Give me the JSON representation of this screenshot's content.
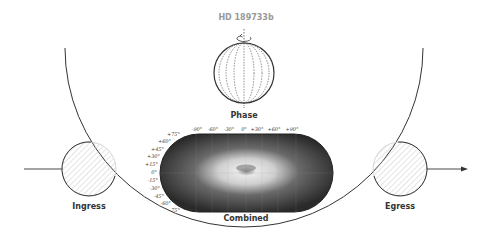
{
  "title": "HD 189733b",
  "labels": {
    "phase": "Phase",
    "combined": "Combined",
    "ingress": "Ingress",
    "egress": "Egress"
  },
  "map": {
    "longitude_ticks": [
      "-90°",
      "-60°",
      "-30°",
      "0°",
      "+30°",
      "+60°",
      "+90°"
    ],
    "latitude_ticks": [
      "+75°",
      "+60°",
      "+45°",
      "+30°",
      "+15°",
      "0°",
      "-15°",
      "-30°",
      "-45°",
      "-60°",
      "-75°"
    ]
  },
  "icons": [
    "rotation-arrow-icon",
    "planet-sphere-icon",
    "orbit-arc",
    "direction-arrow-icon"
  ],
  "colors": {
    "line": "#333333",
    "map_dark": "#2a2a2a",
    "map_bright": "#e8e8e8"
  }
}
